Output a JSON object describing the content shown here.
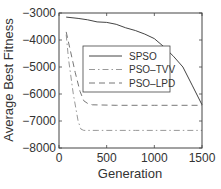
{
  "chart_data": {
    "type": "line",
    "title": "",
    "xlabel": "Generation",
    "ylabel": "Average Best Fitness",
    "xlim": [
      0,
      1500
    ],
    "ylim": [
      -8000,
      -3000
    ],
    "xticks": [
      0,
      500,
      1000,
      1500
    ],
    "yticks": [
      -3000,
      -4000,
      -5000,
      -6000,
      -7000,
      -8000
    ],
    "xtick_labels": [
      "0",
      "500",
      "1000",
      "1500"
    ],
    "ytick_labels": [
      "−3000",
      "−4000",
      "−5000",
      "−6000",
      "−7000",
      "−8000"
    ],
    "grid": false,
    "legend_position": "upper center",
    "series": [
      {
        "name": "SPSO",
        "style": "solid",
        "color": "#444444",
        "x": [
          75,
          200,
          300,
          400,
          500,
          600,
          700,
          800,
          900,
          1000,
          1100,
          1200,
          1300,
          1400,
          1500
        ],
        "y": [
          -3150,
          -3200,
          -3250,
          -3330,
          -3350,
          -3420,
          -3550,
          -3650,
          -3780,
          -3950,
          -4250,
          -4600,
          -5000,
          -5700,
          -6400
        ]
      },
      {
        "name": "PSO–TVV",
        "style": "dashdot",
        "color": "#999999",
        "x": [
          75,
          100,
          150,
          200,
          230,
          260,
          400,
          800,
          1200,
          1500
        ],
        "y": [
          -3800,
          -4700,
          -6000,
          -7000,
          -7300,
          -7350,
          -7350,
          -7350,
          -7350,
          -7350
        ]
      },
      {
        "name": "PSO–LPD",
        "style": "dashed",
        "color": "#777777",
        "x": [
          75,
          120,
          170,
          220,
          260,
          300,
          350,
          600,
          1000,
          1500
        ],
        "y": [
          -3700,
          -4400,
          -5200,
          -5900,
          -6250,
          -6350,
          -6400,
          -6420,
          -6420,
          -6420
        ]
      }
    ]
  },
  "legend": {
    "items": [
      {
        "label": "SPSO"
      },
      {
        "label": "PSO–TVV"
      },
      {
        "label": "PSO–LPD"
      }
    ]
  }
}
